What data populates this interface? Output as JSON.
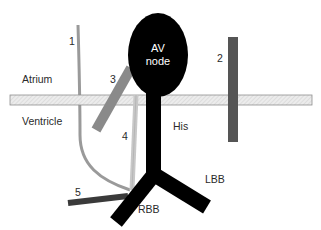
{
  "diagram": {
    "regions": {
      "atrium": "Atrium",
      "ventricle": "Ventricle"
    },
    "structures": {
      "av_node_line1": "AV",
      "av_node_line2": "node",
      "his": "His",
      "lbb": "LBB",
      "rbb": "RBB"
    },
    "pathways": [
      {
        "id": "1",
        "label": "1",
        "color": "#9a9a9a"
      },
      {
        "id": "2",
        "label": "2",
        "color": "#555555"
      },
      {
        "id": "3",
        "label": "3",
        "color": "#8a8a8a"
      },
      {
        "id": "4",
        "label": "4",
        "color": "#c8c8c8"
      },
      {
        "id": "5",
        "label": "5",
        "color": "#3a3a3a"
      }
    ],
    "colors": {
      "conduction_system": "#000000",
      "annulus_fill": "#e6e6e6",
      "annulus_border": "#8f8f8f"
    }
  }
}
